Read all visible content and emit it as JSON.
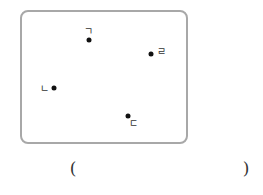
{
  "figure": {
    "border_color": "#a8a8a8",
    "points": [
      {
        "label": "ㄱ",
        "dot": {
          "x": 89,
          "y": 40
        },
        "label_pos": {
          "x": 88,
          "y": 32
        }
      },
      {
        "label": "ㄹ",
        "dot": {
          "x": 151,
          "y": 54
        },
        "label_pos": {
          "x": 161,
          "y": 52
        }
      },
      {
        "label": "ㄴ",
        "dot": {
          "x": 54,
          "y": 88
        },
        "label_pos": {
          "x": 44,
          "y": 89
        }
      },
      {
        "label": "ㄷ",
        "dot": {
          "x": 128,
          "y": 116
        },
        "label_pos": {
          "x": 133,
          "y": 124
        }
      }
    ]
  },
  "answer": {
    "open_paren": "(",
    "close_paren": ")",
    "value": ""
  }
}
